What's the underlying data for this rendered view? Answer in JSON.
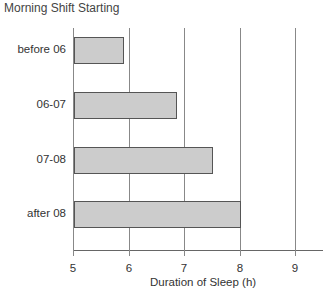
{
  "chart_data": {
    "type": "bar",
    "orientation": "horizontal",
    "title": "Morning Shift Starting",
    "categories": [
      "before 06",
      "06-07",
      "07-08",
      "after 08"
    ],
    "values": [
      5.9,
      6.85,
      7.5,
      8.0
    ],
    "xlabel": "Duration of Sleep (h)",
    "ylabel": "Morning Shift Starting",
    "xlim": [
      5,
      9.5
    ],
    "x_ticks": [
      "5",
      "6",
      "7",
      "8",
      "9"
    ],
    "grid": true,
    "legend": null,
    "colors": {
      "bar_fill": "#cccccc",
      "bar_border": "#555555",
      "grid": "#888888"
    }
  }
}
